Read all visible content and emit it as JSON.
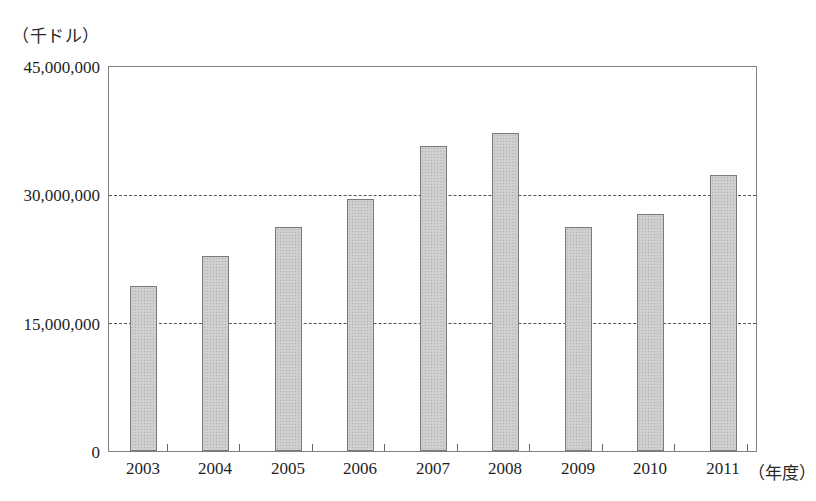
{
  "figure": {
    "y_unit_caption": "（千ドル）",
    "x_axis_caption": "（年度）",
    "zero_label": "0"
  },
  "chart_data": {
    "type": "bar",
    "title": "",
    "subtitle": "",
    "xlabel": "（年度）",
    "ylabel": "（千ドル）",
    "categories": [
      "2003",
      "2004",
      "2005",
      "2006",
      "2007",
      "2008",
      "2009",
      "2010",
      "2011"
    ],
    "values": [
      19400000,
      22900000,
      26200000,
      29500000,
      35700000,
      37300000,
      26300000,
      27800000,
      32300000
    ],
    "ylim": [
      0,
      45000000
    ],
    "ytick_labels": [
      "45,000,000",
      "30,000,000",
      "15,000,000",
      "0"
    ],
    "ytick_values": [
      45000000,
      30000000,
      15000000,
      0
    ],
    "gridlines": [
      30000000,
      15000000
    ],
    "grid": true,
    "legend": "none",
    "series": [
      {
        "name": "金額",
        "values": [
          19400000,
          22900000,
          26200000,
          29500000,
          35700000,
          37300000,
          26300000,
          27800000,
          32300000
        ]
      }
    ],
    "bar_color": "#cccccc",
    "bar_border_color": "#7a7a7a"
  }
}
